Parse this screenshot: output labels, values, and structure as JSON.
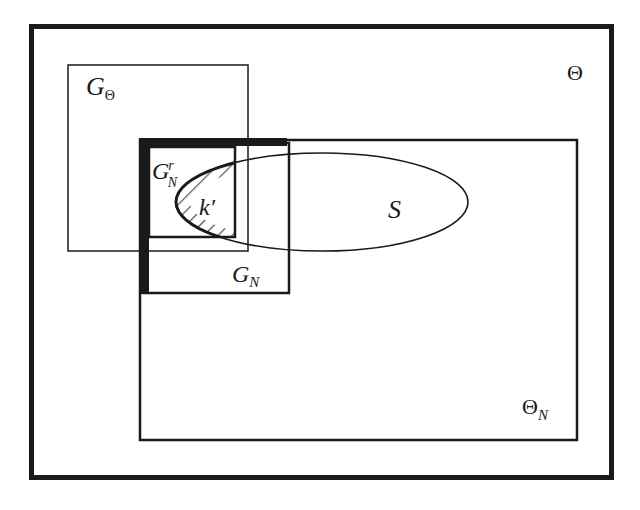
{
  "diagram": {
    "title": "",
    "colors": {
      "stroke": "#1a1a1a",
      "background": "#ffffff",
      "hatch": "#555555"
    },
    "regions": [
      {
        "id": "theta",
        "label_main": "Θ",
        "label_sub": ""
      },
      {
        "id": "theta_n",
        "label_main": "Θ",
        "label_sub": "N"
      },
      {
        "id": "g_theta",
        "label_main": "G",
        "label_sub": "Θ"
      },
      {
        "id": "g_n",
        "label_main": "G",
        "label_sub": "N"
      },
      {
        "id": "g_n_r",
        "label_main": "G",
        "label_sup": "r",
        "label_sub": "N"
      },
      {
        "id": "s",
        "label_main": "S"
      },
      {
        "id": "k_prime",
        "label_main": "k′"
      }
    ]
  }
}
